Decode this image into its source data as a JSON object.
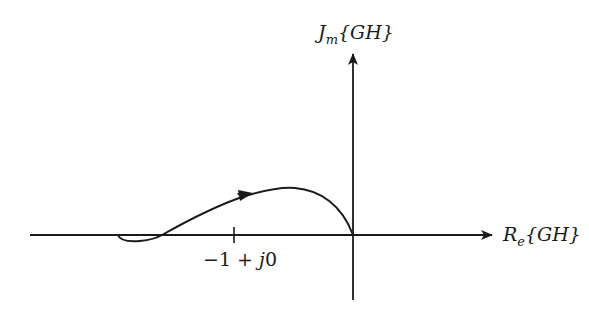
{
  "diagram": {
    "type": "nyquist-plot",
    "y_axis_label": {
      "main": "J",
      "sub": "m",
      "arg": "{GH}"
    },
    "x_axis_label": {
      "main": "R",
      "sub": "e",
      "arg": "{GH}"
    },
    "critical_point_label": {
      "minus_one": "−1",
      "plus": " + ",
      "j": "j",
      "zero": "0"
    },
    "colors": {
      "stroke": "#1a1a1a",
      "background": "#ffffff"
    }
  }
}
